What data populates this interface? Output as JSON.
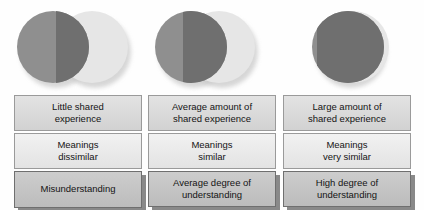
{
  "diagram": {
    "type": "venn-overlap-comparison",
    "colors": {
      "circle_dark": "#8f8f8f",
      "circle_light": "#e6e6e6",
      "circle_overlap": "#6f6f6f",
      "box_top": "#e3e3e3",
      "box_middle": "#f1f1f1",
      "box_bottom": "#cdcdcd",
      "box_border": "#9a9a9a",
      "text": "#141414",
      "background": "#fefefe"
    }
  },
  "columns": [
    {
      "id": "little-shared-experience",
      "venn": {
        "name": "venn-low-overlap",
        "overlap": "small",
        "overlap_percent": 18
      },
      "boxes": [
        {
          "name": "shared-experience-box",
          "line1": "Little shared",
          "line2": "experience"
        },
        {
          "name": "meanings-box",
          "line1": "Meanings",
          "line2": "dissimilar"
        },
        {
          "name": "understanding-box",
          "line1": "Misunderstanding",
          "line2": ""
        }
      ]
    },
    {
      "id": "average-shared-experience",
      "venn": {
        "name": "venn-medium-overlap",
        "overlap": "medium",
        "overlap_percent": 48
      },
      "boxes": [
        {
          "name": "shared-experience-box",
          "line1": "Average amount of",
          "line2": "shared experience"
        },
        {
          "name": "meanings-box",
          "line1": "Meanings",
          "line2": "similar"
        },
        {
          "name": "understanding-box",
          "line1": "Average degree of",
          "line2": "understanding"
        }
      ]
    },
    {
      "id": "large-shared-experience",
      "venn": {
        "name": "venn-high-overlap",
        "overlap": "large",
        "overlap_percent": 92
      },
      "boxes": [
        {
          "name": "shared-experience-box",
          "line1": "Large amount of",
          "line2": "shared experience"
        },
        {
          "name": "meanings-box",
          "line1": "Meanings",
          "line2": "very similar"
        },
        {
          "name": "understanding-box",
          "line1": "High degree of",
          "line2": "understanding"
        }
      ]
    }
  ]
}
